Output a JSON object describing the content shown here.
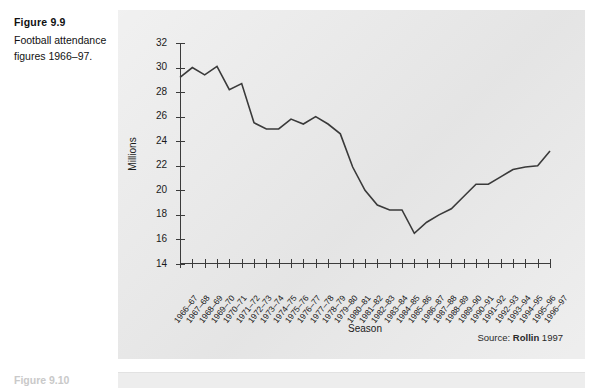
{
  "caption": {
    "title": "Figure 9.9",
    "text": "Football attendance figures 1966–97."
  },
  "next_figure": {
    "title": "Figure 9.10"
  },
  "source_note": {
    "prefix": "Source:",
    "name": "Rollin",
    "year": "1997"
  },
  "chart_data": {
    "type": "line",
    "title": "Football attendance figures 1966–97",
    "xlabel": "Season",
    "ylabel": "Millions",
    "ylim": [
      14,
      32
    ],
    "ytick_values": [
      14,
      16,
      18,
      20,
      22,
      24,
      26,
      28,
      30,
      32
    ],
    "ytick_labels": [
      "14",
      "16",
      "18",
      "20",
      "22",
      "24",
      "26",
      "28",
      "30",
      "32"
    ],
    "grid": false,
    "legend": "none",
    "line_color": "#3a3a3a",
    "categories": [
      "1966–67",
      "1967–68",
      "1968–69",
      "1969–70",
      "1970–71",
      "1971–72",
      "1972–73",
      "1973–74",
      "1974–75",
      "1975–76",
      "1976–77",
      "1977–78",
      "1978–79",
      "1979–80",
      "1980–81",
      "1981–82",
      "1982–83",
      "1983–84",
      "1984–85",
      "1985–86",
      "1986–87",
      "1987–88",
      "1988–89",
      "1989–90",
      "1990–91",
      "1991–92",
      "1992–93",
      "1993–94",
      "1994–95",
      "1995–96",
      "1996–97"
    ],
    "values": [
      29.2,
      30.0,
      29.4,
      30.1,
      28.2,
      28.7,
      25.5,
      25.0,
      25.0,
      25.8,
      25.4,
      26.0,
      25.4,
      24.6,
      21.9,
      20.0,
      18.8,
      18.4,
      18.4,
      16.5,
      17.4,
      18.0,
      18.5,
      19.5,
      20.5,
      20.5,
      21.1,
      21.7,
      21.9,
      22.0,
      23.2
    ]
  }
}
